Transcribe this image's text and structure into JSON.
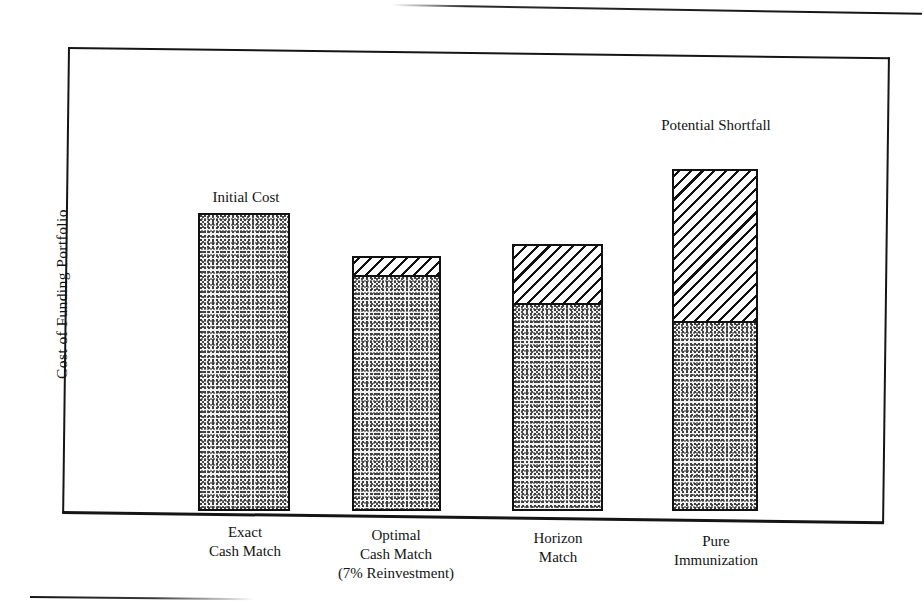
{
  "figure": {
    "y_axis_title": "Cost of Funding Portfolio"
  },
  "annotations": {
    "initial_cost": "Initial Cost",
    "potential_shortfall_line1": "Potential",
    "potential_shortfall_line2": "Shortfall"
  },
  "categories": [
    {
      "line1": "Exact",
      "line2": "Cash Match",
      "line3": ""
    },
    {
      "line1": "Optimal",
      "line2": "Cash Match",
      "line3": "(7% Reinvestment)"
    },
    {
      "line1": "Horizon",
      "line2": "Match",
      "line3": ""
    },
    {
      "line1": "Pure",
      "line2": "Immunization",
      "line3": ""
    }
  ],
  "colors": {
    "ink": "#111111",
    "paper": "#ffffff",
    "stipple_fill": "#f2f2f2",
    "hatch_fill": "#ffffff"
  },
  "chart_data": {
    "type": "bar",
    "title": "",
    "subtitle": "",
    "xlabel": "",
    "ylabel": "Cost of Funding Portfolio",
    "ylim": [
      0,
      100
    ],
    "grid": false,
    "legend": "none",
    "axis_tick_labels": [],
    "stacked": true,
    "categories": [
      "Exact Cash Match",
      "Optimal Cash Match (7% Reinvestment)",
      "Horizon Match",
      "Pure Immunization"
    ],
    "series": [
      {
        "name": "Initial Cost",
        "pattern": "stipple",
        "values": [
          64,
          50,
          44,
          41
        ]
      },
      {
        "name": "Potential Shortfall",
        "pattern": "hatch",
        "values": [
          0,
          4,
          13,
          33
        ]
      }
    ],
    "totals": [
      64,
      54,
      57,
      74
    ],
    "annotations": [
      {
        "text": "Initial Cost",
        "target": "Exact Cash Match",
        "position": "above-bar"
      },
      {
        "text": "Potential Shortfall",
        "target": "Pure Immunization",
        "position": "above-bar"
      }
    ]
  },
  "bars": [
    {
      "name": "exact-cash-match",
      "left": 198,
      "width": 92,
      "top": 213,
      "bottom": 511,
      "split_y": null
    },
    {
      "name": "optimal-cash-match",
      "left": 352,
      "width": 89,
      "top": 256,
      "bottom": 511,
      "split_y": 277
    },
    {
      "name": "horizon-match",
      "left": 512,
      "width": 91,
      "top": 244,
      "bottom": 511,
      "split_y": 305
    },
    {
      "name": "pure-immunization",
      "left": 672,
      "width": 86,
      "top": 169,
      "bottom": 511,
      "split_y": 323
    }
  ]
}
